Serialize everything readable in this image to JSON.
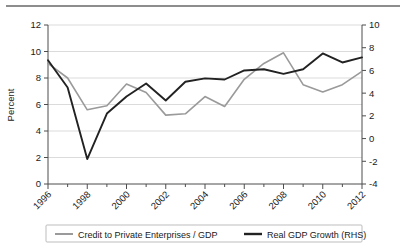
{
  "chart_data": {
    "type": "line",
    "title": "",
    "xlabel": "",
    "ylabel": "Percent",
    "y2label": "",
    "grid": true,
    "legend_position": "bottom",
    "x": [
      1996,
      1997,
      1998,
      1999,
      2000,
      2001,
      2002,
      2003,
      2004,
      2005,
      2006,
      2007,
      2008,
      2009,
      2010,
      2011,
      2012
    ],
    "xtick_labels": [
      "1996",
      "1998",
      "2000",
      "2002",
      "2004",
      "2006",
      "2008",
      "2010",
      "2012"
    ],
    "xtick_values": [
      1996,
      1998,
      2000,
      2002,
      2004,
      2006,
      2008,
      2010,
      2012
    ],
    "xlim": [
      1996,
      2012
    ],
    "ylim": [
      0,
      12
    ],
    "ytick_labels": [
      "0",
      "2",
      "4",
      "6",
      "8",
      "10",
      "12"
    ],
    "ytick_values": [
      0,
      2,
      4,
      6,
      8,
      10,
      12
    ],
    "y2lim": [
      -4,
      10
    ],
    "y2tick_labels": [
      "-4",
      "-2",
      "0",
      "2",
      "4",
      "6",
      "8",
      "10"
    ],
    "y2tick_values": [
      -4,
      -2,
      0,
      2,
      4,
      6,
      8,
      10
    ],
    "series": [
      {
        "name": "Credit to Private Enterprises / GDP",
        "axis": "left",
        "color": "#9a9a9a",
        "values": [
          9.1,
          8.0,
          5.6,
          5.9,
          7.55,
          6.9,
          5.2,
          5.3,
          6.6,
          5.85,
          7.9,
          9.1,
          9.9,
          7.5,
          6.95,
          7.5,
          8.5
        ]
      },
      {
        "name": "Real GDP Growth (RHS)",
        "axis": "right",
        "color": "#222222",
        "values": [
          6.9,
          4.5,
          -1.8,
          2.2,
          3.7,
          4.85,
          3.35,
          5.0,
          5.3,
          5.2,
          6.0,
          6.1,
          5.7,
          6.1,
          7.5,
          6.7,
          7.15
        ]
      }
    ]
  },
  "legend": {
    "entries": [
      {
        "label": "Credit to Private Enterprises / GDP",
        "color": "#9a9a9a",
        "swatch": "line-swatch-gray"
      },
      {
        "label": "Real GDP Growth (RHS)",
        "color": "#222222",
        "swatch": "line-swatch-black"
      }
    ]
  }
}
